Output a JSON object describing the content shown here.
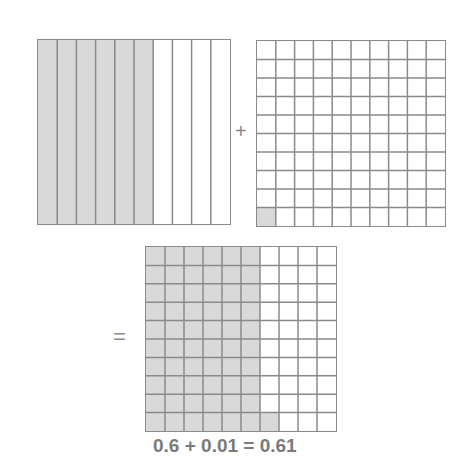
{
  "diagram": {
    "colors": {
      "shade": "#d9d9d9",
      "line": "#8a8a8a",
      "text": "#7a7a7a"
    },
    "tenths_grid": {
      "columns": 10,
      "rows": 1,
      "shaded_columns": 6,
      "value": "0.6"
    },
    "hundredths_grid": {
      "columns": 10,
      "rows": 10,
      "shaded_cells": 1,
      "value": "0.01"
    },
    "sum_grid": {
      "columns": 10,
      "rows": 10,
      "shaded_columns": 6,
      "extra_shaded_cells": 1,
      "value": "0.61"
    },
    "plus_symbol": "+",
    "equals_symbol": "=",
    "equation": "0.6 + 0.01 = 0.61"
  }
}
